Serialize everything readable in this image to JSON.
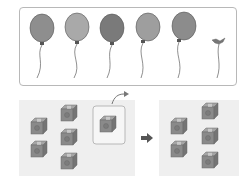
{
  "illustration": {
    "top_panel": {
      "balloons": [
        {
          "cx": 42,
          "cy": 28,
          "fill": "#8e8e8e"
        },
        {
          "cx": 77,
          "cy": 27,
          "fill": "#a9a9a9"
        },
        {
          "cx": 112,
          "cy": 28,
          "fill": "#7a7a7a"
        },
        {
          "cx": 148,
          "cy": 27,
          "fill": "#9e9e9e"
        },
        {
          "cx": 184,
          "cy": 26,
          "fill": "#8c8c8c"
        }
      ],
      "popped_balloon": {
        "x": 218,
        "y": 41
      }
    },
    "bottom_panel": {
      "left_group_cubes": 5,
      "highlighted_cubes": 1,
      "right_group_cubes": 5,
      "arrow": "right-arrow"
    },
    "colors": {
      "panel_border": "#b8b8b8",
      "panel_bg": "#efefef",
      "cube": "#8a8a8a",
      "arrow": "#555555"
    }
  }
}
